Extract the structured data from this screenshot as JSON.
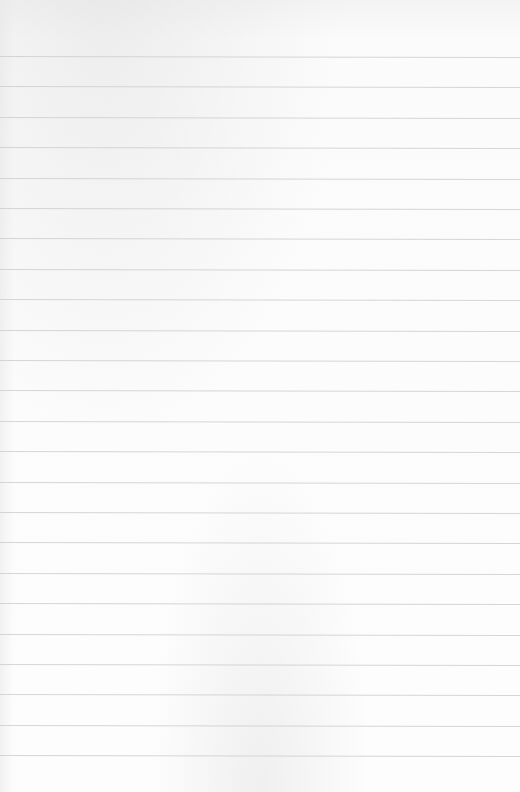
{
  "page": {
    "type": "lined-paper",
    "background_color": "#fcfcfc",
    "rule_color": "#cfcfcf",
    "rule_count": 24,
    "first_rule_y": 56,
    "rule_spacing": 30.4
  }
}
